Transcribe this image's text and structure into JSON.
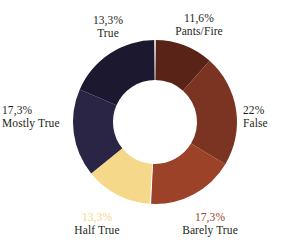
{
  "chart_data": {
    "type": "pie",
    "variant": "donut",
    "title": "",
    "subtitle": "",
    "xlabel": "",
    "ylabel": "",
    "legend_position": "none",
    "grid": false,
    "decimal_separator": ",",
    "center_hole": true,
    "categories": [
      "Pants/Fire",
      "False",
      "Barely True",
      "Half True",
      "Mostly True",
      "True"
    ],
    "values": [
      11.6,
      22,
      17.3,
      13.3,
      17.3,
      13.3
    ],
    "labels": [
      "11,6%",
      "22%",
      "17,3%",
      "13,3%",
      "17,3%",
      "13,3%"
    ],
    "colors": [
      "#5a2318",
      "#7b3422",
      "#9c4228",
      "#f5d889",
      "#2a2545",
      "#1c1830"
    ],
    "slices": [
      {
        "name": "Pants/Fire",
        "value": 11.6,
        "pct_label": "11,6%",
        "name_label": "Pants/Fire",
        "color": "#5a2318",
        "pct_text_color": "#231f20",
        "name_text_color": "#231f20",
        "start_angle": 0,
        "end_angle": 41.76
      },
      {
        "name": "False",
        "value": 22,
        "pct_label": "22%",
        "name_label": "False",
        "color": "#7b3422",
        "pct_text_color": "#231f20",
        "name_text_color": "#231f20",
        "start_angle": 41.76,
        "end_angle": 120.96
      },
      {
        "name": "Barely True",
        "value": 17.3,
        "pct_label": "17,3%",
        "name_label": "Barely True",
        "color": "#9c4228",
        "pct_text_color": "#9c4228",
        "name_text_color": "#231f20",
        "start_angle": 120.96,
        "end_angle": 183.24
      },
      {
        "name": "Half True",
        "value": 13.3,
        "pct_label": "13,3%",
        "name_label": "Half True",
        "color": "#f5d889",
        "pct_text_color": "#f5d889",
        "name_text_color": "#231f20",
        "start_angle": 183.24,
        "end_angle": 231.12
      },
      {
        "name": "Mostly True",
        "value": 17.3,
        "pct_label": "17,3%",
        "name_label": "Mostly True",
        "color": "#2a2545",
        "pct_text_color": "#231f20",
        "name_text_color": "#231f20",
        "start_angle": 231.12,
        "end_angle": 293.4
      },
      {
        "name": "True",
        "value": 13.3,
        "pct_label": "13,3%",
        "name_label": "True",
        "color": "#1c1830",
        "pct_text_color": "#231f20",
        "name_text_color": "#231f20",
        "start_angle": 293.4,
        "end_angle": 360
      }
    ]
  },
  "geometry": {
    "center_x": 155,
    "center_y": 122,
    "outer_radius": 82,
    "inner_radius": 42,
    "background": "#ffffff"
  }
}
